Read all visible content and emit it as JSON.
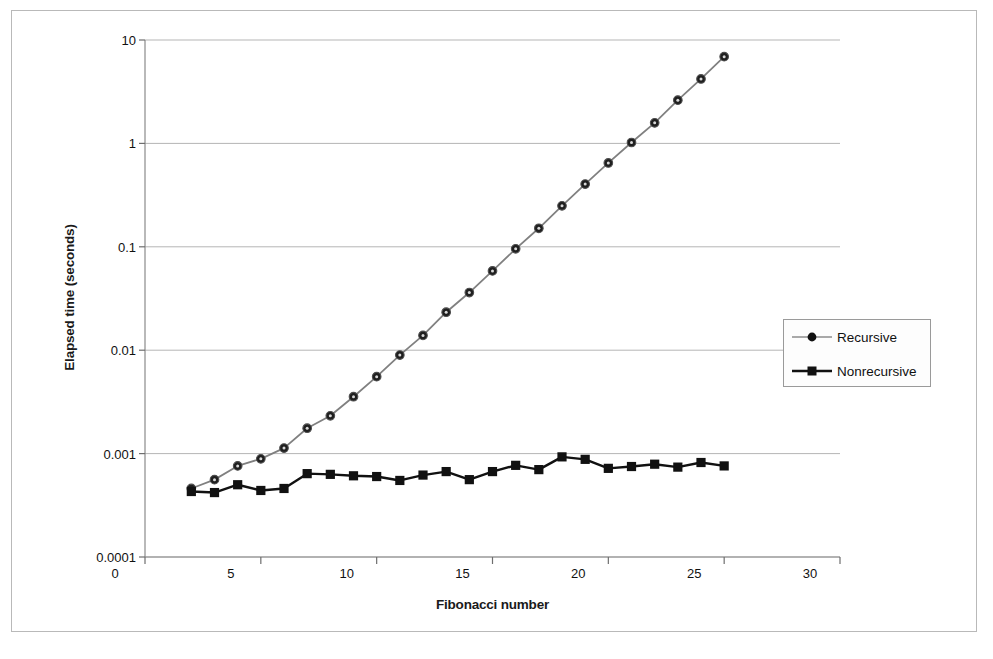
{
  "chart_data": {
    "type": "line",
    "title": "",
    "xlabel": "Fibonacci number",
    "ylabel": "Elapsed time (seconds)",
    "xlim": [
      0,
      30
    ],
    "ylim": [
      0.0001,
      10
    ],
    "yscale": "log",
    "grid": "horizontal",
    "legend_position": "right-middle",
    "xticks": [
      "0",
      "5",
      "10",
      "15",
      "20",
      "25",
      "30"
    ],
    "xtick_values": [
      0,
      5,
      10,
      15,
      20,
      25,
      30
    ],
    "yticks": [
      "10",
      "1",
      "0.1",
      "0.01",
      "0.001",
      "0.0001"
    ],
    "ytick_values": [
      10,
      1,
      0.1,
      0.01,
      0.001,
      0.0001
    ],
    "x": [
      2,
      3,
      4,
      5,
      6,
      7,
      8,
      9,
      10,
      11,
      12,
      13,
      14,
      15,
      16,
      17,
      18,
      19,
      20,
      21,
      22,
      23,
      24,
      25
    ],
    "series": [
      {
        "name": "Recursive",
        "marker": "circle",
        "color": "#1a1a1a",
        "line_color": "#808080",
        "values": [
          0.00046,
          0.00056,
          0.00076,
          0.00089,
          0.00113,
          0.00176,
          0.00232,
          0.00355,
          0.00555,
          0.00897,
          0.0139,
          0.0233,
          0.0361,
          0.0585,
          0.0956,
          0.151,
          0.249,
          0.404,
          0.647,
          1.02,
          1.58,
          2.62,
          4.2,
          6.9
        ]
      },
      {
        "name": "Nonrecursive",
        "marker": "square",
        "color": "#111111",
        "line_color": "#111111",
        "values": [
          0.00043,
          0.00042,
          0.0005,
          0.00044,
          0.00046,
          0.00064,
          0.00063,
          0.00061,
          0.0006,
          0.00055,
          0.00062,
          0.00067,
          0.00056,
          0.00067,
          0.00077,
          0.0007,
          0.00093,
          0.00088,
          0.00072,
          0.00075,
          0.00079,
          0.00074,
          0.00082,
          0.00076
        ]
      }
    ]
  },
  "legend": {
    "items": [
      {
        "label": "Recursive"
      },
      {
        "label": "Nonrecursive"
      }
    ]
  }
}
